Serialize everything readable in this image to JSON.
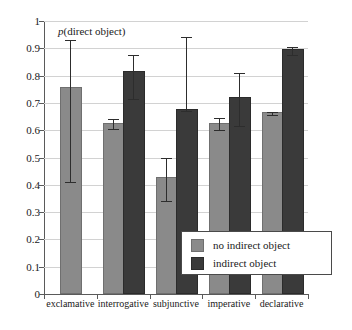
{
  "chart_data": {
    "type": "bar",
    "title": "",
    "annotation": "p(direct object)",
    "annotation_italic_prefix": "p",
    "annotation_rest": "(direct object)",
    "xlabel": "",
    "ylabel": "",
    "ylim": [
      0,
      1
    ],
    "ytick_values": [
      0,
      0.1,
      0.2,
      0.3,
      0.4,
      0.5,
      0.6,
      0.7,
      0.8,
      0.9,
      1
    ],
    "ytick_labels": [
      "0",
      "0.1",
      "0.2",
      "0.3",
      "0.4",
      "0.5",
      "0.6",
      "0.7",
      "0.8",
      "0.9",
      "1"
    ],
    "grid": true,
    "legend_position": "center-right-inside",
    "categories": [
      "exclamative",
      "interrogative",
      "subjunctive",
      "imperative",
      "declarative"
    ],
    "series": [
      {
        "name": "no indirect object",
        "color": "#8a8a8a",
        "values": [
          0.75,
          0.62,
          0.42,
          0.62,
          0.66
        ],
        "err_low": [
          0.41,
          0.605,
          0.34,
          0.6,
          0.655
        ],
        "err_high": [
          0.93,
          0.64,
          0.5,
          0.645,
          0.665
        ]
      },
      {
        "name": "indirect object",
        "color": "#3a3a3a",
        "values": [
          null,
          0.81,
          0.67,
          0.715,
          0.89
        ],
        "err_low": [
          null,
          0.715,
          0.67,
          0.615,
          0.875
        ],
        "err_high": [
          null,
          0.875,
          0.94,
          0.81,
          0.905
        ]
      }
    ]
  },
  "legend": {
    "items": [
      {
        "label": "no indirect object",
        "swatch": "light"
      },
      {
        "label": "indirect object",
        "swatch": "dark"
      }
    ]
  },
  "caption": ""
}
